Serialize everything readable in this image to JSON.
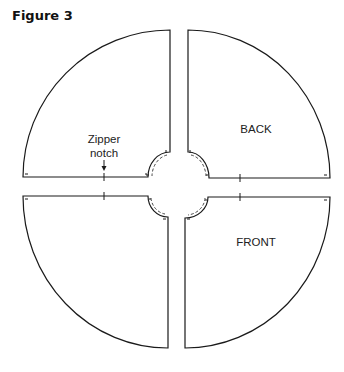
{
  "figure": {
    "title": "Figure 3"
  },
  "pieces": [
    {
      "id": "top-left",
      "label": ""
    },
    {
      "id": "top-right",
      "label": "BACK"
    },
    {
      "id": "bottom-left",
      "label": ""
    },
    {
      "id": "bottom-right",
      "label": "FRONT"
    }
  ],
  "annotations": {
    "zipper_line1": "Zipper",
    "zipper_line2": "notch"
  },
  "colors": {
    "line": "#1a1a1a",
    "background": "#ffffff"
  }
}
